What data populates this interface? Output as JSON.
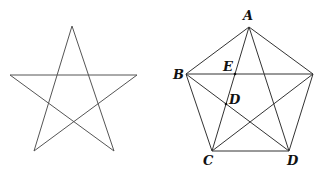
{
  "figures": {
    "star": {
      "points": [
        [
          72,
          26
        ],
        [
          34,
          151
        ],
        [
          137,
          75
        ],
        [
          10,
          75
        ],
        [
          114,
          151
        ]
      ]
    },
    "pentagon": {
      "vertices": {
        "A": [
          249,
          27
        ],
        "B": [
          186,
          74
        ],
        "R": [
          313,
          74
        ],
        "D": [
          289,
          151
        ],
        "C": [
          212,
          151
        ]
      },
      "labels": {
        "A": {
          "text": "A",
          "x": 243,
          "y": 20
        },
        "B": {
          "text": "B",
          "x": 173,
          "y": 79
        },
        "E": {
          "text": "E",
          "x": 223,
          "y": 71
        },
        "D_inner": {
          "text": "D",
          "x": 229,
          "y": 104
        },
        "C": {
          "text": "C",
          "x": 203,
          "y": 165
        },
        "D": {
          "text": "D",
          "x": 287,
          "y": 165
        }
      }
    }
  },
  "stroke_color": "#555555"
}
